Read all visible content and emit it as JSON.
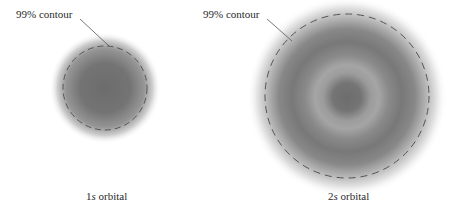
{
  "figure": {
    "orbitals": [
      {
        "id": "1s",
        "contour_label": "99% contour",
        "caption_prefix": "1",
        "caption_italic": "s",
        "caption_suffix": " orbital",
        "center": [
          105,
          88
        ],
        "contour_radius": 42
      },
      {
        "id": "2s",
        "contour_label": "99% contour",
        "caption_prefix": "2",
        "caption_italic": "s",
        "caption_suffix": " orbital",
        "center": [
          347,
          96
        ],
        "contour_radius": 82
      }
    ],
    "colors": {
      "density": "#6e6e6e",
      "contour": "#555555",
      "background": "#ffffff"
    }
  }
}
